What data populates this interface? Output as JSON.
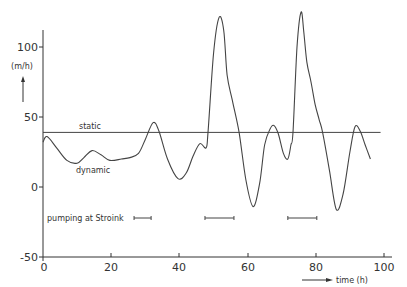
{
  "chart_data": {
    "type": "line",
    "title": "",
    "xlabel": "time (h)",
    "ylabel": "(m/h)",
    "xlim": [
      0,
      100
    ],
    "ylim": [
      -50,
      125
    ],
    "x_ticks": [
      0,
      20,
      40,
      60,
      80,
      100
    ],
    "y_ticks": [
      -50,
      0,
      50,
      100
    ],
    "x_tick_labels": [
      "0",
      "20",
      "40",
      "60",
      "80",
      "100"
    ],
    "y_tick_labels": [
      "-50",
      "0",
      "50",
      "100"
    ],
    "grid": false,
    "series": [
      {
        "name": "static",
        "label": "static",
        "x": [
          0,
          99
        ],
        "values": [
          39,
          39
        ]
      },
      {
        "name": "dynamic",
        "label": "dynamic",
        "x": [
          0,
          1.2,
          4,
          7,
          10,
          12,
          14.4,
          17,
          19.6,
          23,
          25.5,
          28,
          30,
          32.3,
          34,
          36.5,
          39.6,
          42,
          44,
          46,
          47.8,
          48.4,
          50,
          51.6,
          53,
          54,
          55.5,
          57.5,
          59.5,
          61.6,
          63.5,
          65,
          66.5,
          67.7,
          69,
          70.5,
          71.8,
          72.7,
          73.3,
          74.5,
          75.7,
          76.5,
          77.4,
          78.6,
          79.8,
          81,
          82,
          84,
          86,
          88,
          90,
          91.5,
          93,
          94.5,
          96
        ],
        "values": [
          32,
          36,
          28,
          19,
          17,
          21,
          26,
          23,
          19,
          20,
          21,
          24,
          34,
          46,
          40,
          20,
          6,
          10,
          22,
          31,
          28,
          39,
          95,
          121,
          112,
          80,
          62,
          39,
          5,
          -14,
          2,
          30,
          41,
          44,
          38,
          24,
          20,
          30,
          39,
          100,
          125,
          110,
          89,
          75,
          59,
          48,
          39,
          12,
          -16,
          -5,
          25,
          43,
          40,
          30,
          20
        ]
      }
    ],
    "annotations": [
      {
        "text": "static",
        "x": 10,
        "y": 41
      },
      {
        "text": "dynamic",
        "x": 8,
        "y": 10
      },
      {
        "text": "pumping at Stroink",
        "x": 1,
        "y": -23
      }
    ],
    "pumping_intervals": [
      [
        26.7,
        31.7
      ],
      [
        47.5,
        56
      ],
      [
        71.8,
        80.3
      ]
    ]
  },
  "labels": {
    "y_unit": "(m/h)",
    "x_unit": "time (h)",
    "static": "static",
    "dynamic": "dynamic",
    "pumping": "pumping at Stroink",
    "y_ticks": [
      "100",
      "50",
      "0",
      "-50"
    ],
    "x_ticks": [
      "0",
      "20",
      "40",
      "60",
      "80",
      "100"
    ]
  }
}
